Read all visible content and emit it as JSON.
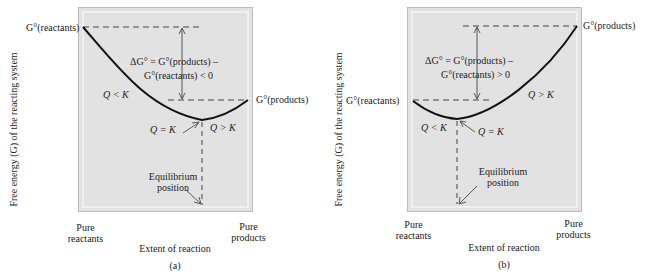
{
  "panels": [
    {
      "id": "a",
      "caption": "(a)",
      "y_axis_label": "Free energy (G) of the reacting system",
      "x_axis_label": "Extent of reaction",
      "x_left_label": [
        "Pure",
        "reactants"
      ],
      "x_right_label": [
        "Pure",
        "products"
      ],
      "g_reactants_label": "G°(reactants)",
      "g_products_label": "G°(products)",
      "delta_g_line1": "ΔG° = G°(products) –",
      "delta_g_line2": "G°(reactants) < 0",
      "q_less_k": "Q < K",
      "q_equals_k": "Q = K",
      "q_greater_k": "Q > K",
      "equilibrium_line1": "Equilibrium",
      "equilibrium_line2": "position"
    },
    {
      "id": "b",
      "caption": "(b)",
      "y_axis_label": "Free energy (G) of the reacting system",
      "x_axis_label": "Extent of reaction",
      "x_left_label": [
        "Pure",
        "reactants"
      ],
      "x_right_label": [
        "Pure",
        "products"
      ],
      "g_reactants_label": "G°(reactants)",
      "g_products_label": "G°(products)",
      "delta_g_line1": "ΔG° = G°(products) –",
      "delta_g_line2": "G°(reactants) > 0",
      "q_less_k": "Q < K",
      "q_equals_k": "Q = K",
      "q_greater_k": "Q > K",
      "equilibrium_line1": "Equilibrium",
      "equilibrium_line2": "position"
    }
  ],
  "colors": {
    "frame_fill": "#e2e2e2",
    "frame_border": "#bdbdbd",
    "curve": "#111111"
  }
}
